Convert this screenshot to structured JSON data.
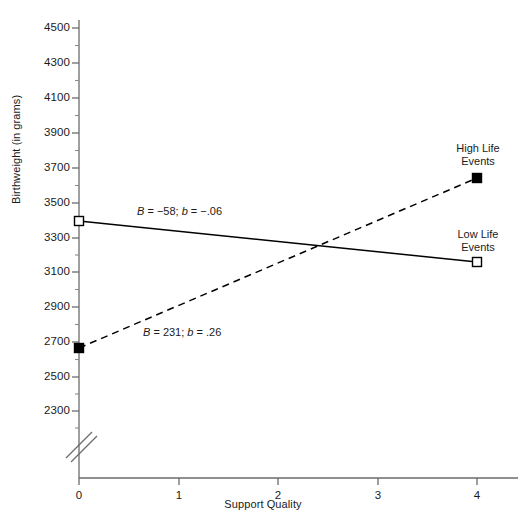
{
  "chart_data": {
    "type": "line",
    "title": "",
    "xlabel": "Support Quality",
    "ylabel": "Birthweight (in grams)",
    "xlim": [
      0,
      4
    ],
    "ylim": [
      2300,
      4500
    ],
    "xticks": [
      "0",
      "1",
      "2",
      "3",
      "4"
    ],
    "yticks": [
      "4500",
      "4300",
      "4100",
      "3900",
      "3700",
      "3500",
      "3300",
      "3100",
      "2900",
      "2700",
      "2500",
      "2300"
    ],
    "y_axis_break": true,
    "grid": false,
    "legend_position": "inline-right",
    "series": [
      {
        "name": "Low Life Events",
        "label": "Low Life\nEvents",
        "label_line1": "Low Life",
        "label_line2": "Events",
        "linestyle": "solid",
        "marker": "open-square",
        "x": [
          0,
          4
        ],
        "values": [
          3400,
          3168
        ],
        "annotation": "B = −58; b = −.06",
        "annotation_B": "−58",
        "annotation_b": "−.06"
      },
      {
        "name": "High Life Events",
        "label": "High Life\nEvents",
        "label_line1": "High Life",
        "label_line2": "Events",
        "linestyle": "dashed",
        "marker": "filled-square",
        "x": [
          0,
          4
        ],
        "values": [
          2700,
          3624
        ],
        "annotation": "B = 231; b = .26",
        "annotation_B": "231",
        "annotation_b": ".26"
      }
    ],
    "colors": {
      "axis": "#555555",
      "line": "#000000",
      "text": "#1a1a1a",
      "background": "#ffffff"
    }
  },
  "axis": {
    "y_title": "Birthweight (in grams)",
    "x_title": "Support Quality",
    "ytick_labels": [
      "4500",
      "4300",
      "4100",
      "3900",
      "3700",
      "3500",
      "3300",
      "3100",
      "2900",
      "2700",
      "2500",
      "2300"
    ],
    "xtick_labels": [
      "0",
      "1",
      "2",
      "3",
      "4"
    ]
  },
  "annotations": {
    "low_life": "B = −58; b = −.06",
    "high_life": "B = 231; b = .26"
  },
  "series_labels": {
    "high_line1": "High Life",
    "high_line2": "Events",
    "low_line1": "Low Life",
    "low_line2": "Events"
  }
}
